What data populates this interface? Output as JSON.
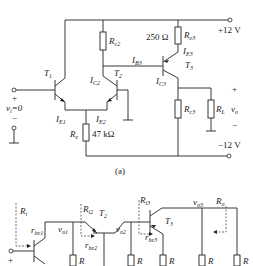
{
  "figure_a": {
    "caption": "(a)",
    "supply_pos": "+12 V",
    "supply_neg": "−12 V",
    "input_label": "v",
    "input_sub": "i",
    "input_value": "=0",
    "output_label": "v",
    "output_sub": "o",
    "plus": "+",
    "minus": "−",
    "transistors": [
      {
        "name": "T",
        "sub": "1"
      },
      {
        "name": "T",
        "sub": "2"
      },
      {
        "name": "T",
        "sub": "3"
      }
    ],
    "resistors": {
      "rc2": {
        "name": "R",
        "sub": "c2"
      },
      "re3": {
        "name": "R",
        "sub": "e3",
        "value": "250 Ω"
      },
      "rc3": {
        "name": "R",
        "sub": "c3"
      },
      "rl": {
        "name": "R",
        "sub": "L"
      },
      "re": {
        "name": "R",
        "sub": "e",
        "value": "47 kΩ"
      }
    },
    "currents": {
      "ie1": {
        "name": "I",
        "sub": "E1"
      },
      "ie2": {
        "name": "I",
        "sub": "E2"
      },
      "ic2": {
        "name": "I",
        "sub": "C2"
      },
      "ib3": {
        "name": "I",
        "sub": "B3"
      },
      "ie3": {
        "name": "I",
        "sub": "E3"
      },
      "ic3": {
        "name": "I",
        "sub": "C3"
      }
    }
  },
  "figure_b": {
    "labels": {
      "ri": {
        "name": "R",
        "sub": "i"
      },
      "ri2": {
        "name": "R",
        "sub": "i2"
      },
      "ri3": {
        "name": "R",
        "sub": "i3"
      },
      "ro": {
        "name": "R",
        "sub": "o"
      },
      "rbe1": {
        "name": "r",
        "sub": "be1"
      },
      "rbe2": {
        "name": "r",
        "sub": "be2"
      },
      "rbe3": {
        "name": "r",
        "sub": "be3"
      },
      "vo1": {
        "name": "v",
        "sub": "o1"
      },
      "vo2": {
        "name": "v",
        "sub": "o2"
      },
      "vo3": {
        "name": "v",
        "sub": "o3"
      },
      "t2": {
        "name": "T",
        "sub": "2"
      },
      "t3": {
        "name": "T",
        "sub": "3"
      },
      "t1": {
        "name": "T",
        "sub": ""
      },
      "plus": "+"
    },
    "resistors": [
      {
        "name": "R",
        "sub": ""
      },
      {
        "name": "R",
        "sub": "c2"
      },
      {
        "name": "R",
        "sub": "e3"
      },
      {
        "name": "R",
        "sub": "c3"
      },
      {
        "name": "R",
        "sub": "L"
      }
    ]
  }
}
